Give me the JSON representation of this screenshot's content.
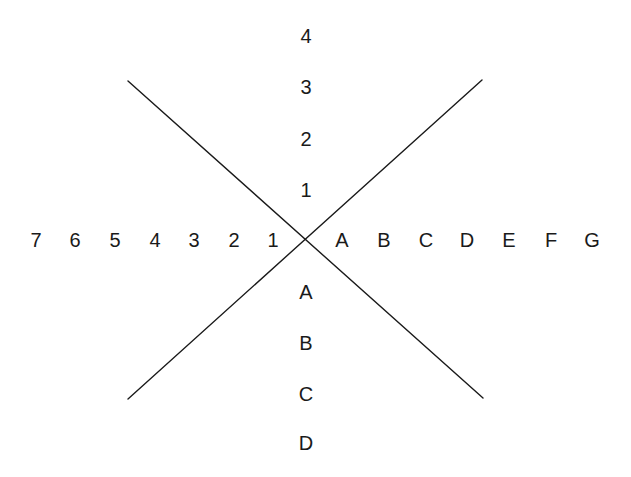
{
  "figure": {
    "width": 631,
    "height": 477,
    "background_color": "#ffffff",
    "line_color": "#1a1a1a",
    "text_color": "#1a1a1a",
    "line_width": 1.4,
    "origin": {
      "x": 306,
      "y": 241
    }
  },
  "chart_data": {
    "type": "scatter",
    "title": "",
    "subtitle": "",
    "xlabel": "",
    "ylabel": "",
    "grid": false,
    "legend": null,
    "axes": {
      "x_axis": {
        "negative_tick_labels": [
          "7",
          "6",
          "5",
          "4",
          "3",
          "2",
          "1"
        ],
        "positive_tick_labels": [
          "A",
          "B",
          "C",
          "D",
          "E",
          "F",
          "G"
        ]
      },
      "y_axis": {
        "positive_tick_labels": [
          "4",
          "3",
          "2",
          "1"
        ],
        "negative_tick_labels": [
          "A",
          "B",
          "C",
          "D"
        ]
      }
    },
    "series": [
      {
        "name": "line-descending",
        "type": "line",
        "points": [
          {
            "x": 128,
            "y": 81
          },
          {
            "x": 483,
            "y": 398
          }
        ]
      },
      {
        "name": "line-ascending",
        "type": "line",
        "points": [
          {
            "x": 128,
            "y": 399
          },
          {
            "x": 482,
            "y": 80
          }
        ]
      }
    ]
  },
  "labels": {
    "x_negative": [
      {
        "text": "7",
        "x": 36,
        "y": 240
      },
      {
        "text": "6",
        "x": 75,
        "y": 240
      },
      {
        "text": "5",
        "x": 115,
        "y": 240
      },
      {
        "text": "4",
        "x": 155,
        "y": 240
      },
      {
        "text": "3",
        "x": 194,
        "y": 240
      },
      {
        "text": "2",
        "x": 234,
        "y": 240
      },
      {
        "text": "1",
        "x": 273,
        "y": 240
      }
    ],
    "x_positive": [
      {
        "text": "A",
        "x": 342,
        "y": 240
      },
      {
        "text": "B",
        "x": 384,
        "y": 240
      },
      {
        "text": "C",
        "x": 426,
        "y": 240
      },
      {
        "text": "D",
        "x": 467,
        "y": 240
      },
      {
        "text": "E",
        "x": 509,
        "y": 240
      },
      {
        "text": "F",
        "x": 551,
        "y": 240
      },
      {
        "text": "G",
        "x": 592,
        "y": 240
      }
    ],
    "y_positive": [
      {
        "text": "4",
        "x": 306,
        "y": 36
      },
      {
        "text": "3",
        "x": 306,
        "y": 87
      },
      {
        "text": "2",
        "x": 306,
        "y": 139
      },
      {
        "text": "1",
        "x": 306,
        "y": 190
      }
    ],
    "y_negative": [
      {
        "text": "A",
        "x": 306,
        "y": 292
      },
      {
        "text": "B",
        "x": 306,
        "y": 343
      },
      {
        "text": "C",
        "x": 306,
        "y": 394
      },
      {
        "text": "D",
        "x": 306,
        "y": 443
      }
    ]
  }
}
